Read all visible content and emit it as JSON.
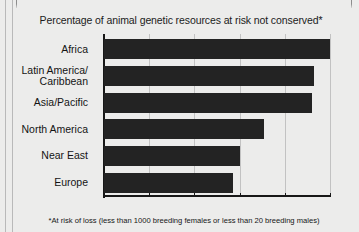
{
  "chart_data": {
    "type": "bar",
    "orientation": "horizontal",
    "title": "Percentage of animal genetic resources at risk not conserved*",
    "footnote": "*At risk of loss (less than 1000 breeding females or less than 20 breeding males)",
    "categories": [
      "Africa",
      "Latin America/\nCaribbean",
      "Asia/Pacific",
      "North America",
      "Near East",
      "Europe"
    ],
    "values": [
      100,
      93,
      92,
      71,
      60,
      57
    ],
    "xlabel": "",
    "ylabel": "",
    "xlim": [
      0,
      100
    ],
    "xticks": [
      0,
      20,
      40,
      60,
      80,
      100
    ],
    "xtick_labels": [
      "0",
      "20",
      "40",
      "60",
      "80",
      "100"
    ],
    "grid": "vertical",
    "legend": "none",
    "bar_color": "#232323",
    "background_color": "#ececeb"
  }
}
